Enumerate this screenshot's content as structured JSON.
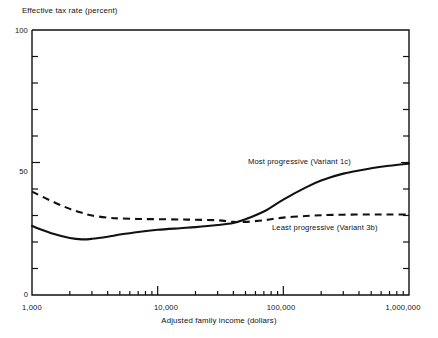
{
  "chart_data": {
    "type": "line",
    "title": "",
    "xlabel": "Adjusted family income (dollars)",
    "ylabel": "Effective tax rate (percent)",
    "xscale": "log",
    "xlim": [
      1000,
      1000000
    ],
    "ylim": [
      0,
      100
    ],
    "grid": false,
    "legend_position": "inline-annotation",
    "xticks": [
      1000,
      10000,
      100000,
      1000000
    ],
    "xticklabels": [
      "1,000",
      "10,000",
      "100,000",
      "1,000,000"
    ],
    "yticks": [
      0,
      10,
      20,
      30,
      40,
      50,
      60,
      70,
      80,
      90,
      100
    ],
    "yticklabels_shown": [
      "0",
      "50",
      "100"
    ],
    "series": [
      {
        "name": "Most progressive (Variant 1c)",
        "style": "solid",
        "x": [
          1000,
          1500,
          2000,
          2500,
          3000,
          4000,
          5000,
          7000,
          10000,
          15000,
          20000,
          30000,
          40000,
          50000,
          70000,
          100000,
          150000,
          200000,
          300000,
          500000,
          700000,
          1000000
        ],
        "y": [
          26.0,
          23.0,
          21.5,
          21.0,
          21.2,
          22.0,
          22.8,
          23.8,
          24.6,
          25.2,
          25.6,
          26.4,
          27.2,
          28.6,
          31.5,
          36.0,
          40.5,
          43.2,
          45.8,
          47.8,
          48.8,
          49.6
        ]
      },
      {
        "name": "Least progressive (Variant 3b)",
        "style": "dashed",
        "x": [
          1000,
          1500,
          2000,
          2500,
          3000,
          4000,
          5000,
          7000,
          10000,
          15000,
          20000,
          30000,
          40000,
          50000,
          70000,
          100000,
          150000,
          200000,
          300000,
          500000,
          700000,
          1000000
        ],
        "y": [
          39.0,
          35.0,
          32.5,
          31.0,
          30.0,
          29.2,
          28.9,
          28.7,
          28.6,
          28.5,
          28.4,
          28.2,
          27.6,
          27.6,
          28.2,
          29.2,
          29.8,
          30.1,
          30.3,
          30.4,
          30.4,
          30.4
        ]
      }
    ],
    "annotations": [
      {
        "text": "Most progressive (Variant 1c)",
        "x_px": 248,
        "y_px": 160
      },
      {
        "text": "Least progressive (Variant 3b)",
        "x_px": 272,
        "y_px": 226
      }
    ]
  }
}
